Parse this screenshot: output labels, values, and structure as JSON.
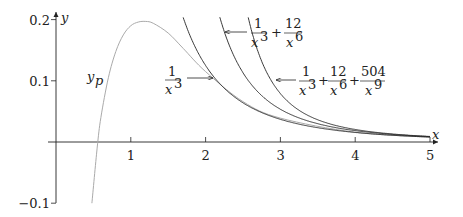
{
  "chart_data": {
    "type": "line",
    "title": "",
    "xlabel": "x",
    "ylabel": "y",
    "xlim": [
      0,
      5
    ],
    "ylim": [
      -0.1,
      0.2
    ],
    "x_ticks": [
      "1",
      "2",
      "3",
      "4",
      "5"
    ],
    "y_ticks": [
      "0.2",
      "0.1",
      "−0.1"
    ],
    "grid": false,
    "legend": "inline annotations with arrows",
    "series": [
      {
        "name": "y_p",
        "label": "y_p",
        "color": "#aaaaaa",
        "x": [
          0.48,
          0.55,
          0.6,
          0.7,
          0.8,
          0.9,
          1.0,
          1.1,
          1.2,
          1.3,
          1.5,
          1.7,
          2.0,
          2.5,
          3.0,
          4.0,
          5.0
        ],
        "y": [
          -0.1,
          -0.01,
          0.04,
          0.105,
          0.148,
          0.175,
          0.19,
          0.196,
          0.197,
          0.194,
          0.178,
          0.153,
          0.115,
          0.066,
          0.039,
          0.016,
          0.008
        ]
      },
      {
        "name": "1/x^3",
        "label_num": "1",
        "label_den": "x",
        "label_exp": "3",
        "formula": "1/x^3",
        "color": "#222222"
      },
      {
        "name": "1/x^3 + 12/x^6",
        "formula": "1/x^3 + 12/x^6",
        "color": "#222222"
      },
      {
        "name": "1/x^3 + 12/x^6 + 504/x^9",
        "formula": "1/x^3 + 12/x^6 + 504/x^9",
        "color": "#222222"
      }
    ],
    "annotations": [
      {
        "text": "y_p",
        "x": 0.45,
        "y": 0.1
      },
      {
        "text": "1/x^3",
        "x": 1.55,
        "y": 0.1
      },
      {
        "text": "1/x^3 + 12/x^6",
        "x": 2.6,
        "y": 0.18
      },
      {
        "text": "1/x^3 + 12/x^6 + 504/x^9",
        "x": 3.3,
        "y": 0.1
      }
    ]
  },
  "axis": {
    "x_label": "x",
    "y_label": "y"
  },
  "labels": {
    "yp_main": "y",
    "yp_sub": "p",
    "one": "1",
    "twelve": "12",
    "five04": "504",
    "x": "x",
    "e3": "3",
    "e6": "6",
    "e9": "9",
    "plus": "+"
  }
}
